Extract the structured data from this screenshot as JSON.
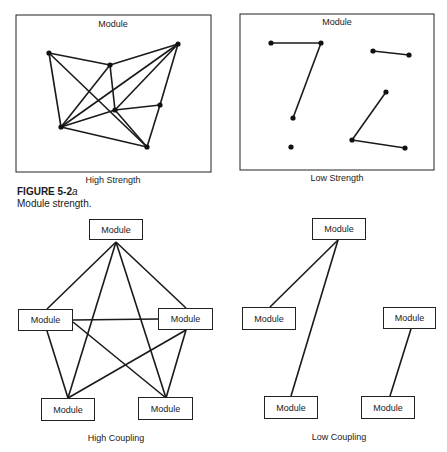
{
  "figure": {
    "number": "FIGURE 5-2",
    "suffix": "a",
    "caption": "Module strength."
  },
  "strength": {
    "high": {
      "title": "Module",
      "label": "High Strength",
      "nodes": [
        [
          49,
          53
        ],
        [
          110,
          65
        ],
        [
          178,
          44
        ],
        [
          115,
          110
        ],
        [
          160,
          105
        ],
        [
          61,
          127
        ],
        [
          147,
          147
        ]
      ],
      "edges": [
        [
          0,
          1
        ],
        [
          1,
          2
        ],
        [
          0,
          5
        ],
        [
          0,
          6
        ],
        [
          1,
          3
        ],
        [
          1,
          5
        ],
        [
          2,
          5
        ],
        [
          2,
          3
        ],
        [
          2,
          4
        ],
        [
          4,
          6
        ],
        [
          3,
          5
        ],
        [
          3,
          4
        ],
        [
          5,
          6
        ],
        [
          3,
          6
        ]
      ]
    },
    "low": {
      "title": "Module",
      "label": "Low Strength",
      "nodes": [
        [
          271,
          43
        ],
        [
          321,
          43
        ],
        [
          293,
          118
        ],
        [
          291,
          147
        ],
        [
          373,
          51
        ],
        [
          409,
          55
        ],
        [
          386,
          92
        ],
        [
          352,
          140
        ],
        [
          405,
          148
        ]
      ],
      "edges": [
        [
          0,
          1
        ],
        [
          1,
          2
        ],
        [
          4,
          5
        ],
        [
          6,
          7
        ],
        [
          7,
          8
        ]
      ]
    }
  },
  "coupling": {
    "high": {
      "label": "High Coupling",
      "modules": [
        {
          "label": "Module",
          "x": 89,
          "y": 219,
          "w": 54,
          "h": 21
        },
        {
          "label": "Module",
          "x": 18,
          "y": 309,
          "w": 55,
          "h": 22
        },
        {
          "label": "Module",
          "x": 158,
          "y": 308,
          "w": 55,
          "h": 22
        },
        {
          "label": "Module",
          "x": 41,
          "y": 398,
          "w": 54,
          "h": 23
        },
        {
          "label": "Module",
          "x": 138,
          "y": 397,
          "w": 55,
          "h": 23
        }
      ],
      "edges": [
        [
          [
            116,
            242
          ],
          [
            47,
            309
          ]
        ],
        [
          [
            116,
            242
          ],
          [
            68,
            398
          ]
        ],
        [
          [
            116,
            242
          ],
          [
            166,
            398
          ]
        ],
        [
          [
            116,
            242
          ],
          [
            186,
            308
          ]
        ],
        [
          [
            73,
            320
          ],
          [
            158,
            319
          ]
        ],
        [
          [
            47,
            331
          ],
          [
            68,
            398
          ]
        ],
        [
          [
            73,
            322
          ],
          [
            166,
            398
          ]
        ],
        [
          [
            186,
            330
          ],
          [
            68,
            398
          ]
        ],
        [
          [
            186,
            330
          ],
          [
            166,
            398
          ]
        ]
      ]
    },
    "low": {
      "label": "Low Coupling",
      "modules": [
        {
          "label": "Module",
          "x": 312,
          "y": 218,
          "w": 54,
          "h": 22
        },
        {
          "label": "Module",
          "x": 242,
          "y": 307,
          "w": 54,
          "h": 23
        },
        {
          "label": "Module",
          "x": 383,
          "y": 307,
          "w": 53,
          "h": 22
        },
        {
          "label": "Module",
          "x": 264,
          "y": 396,
          "w": 54,
          "h": 23
        },
        {
          "label": "Module",
          "x": 361,
          "y": 396,
          "w": 54,
          "h": 23
        }
      ],
      "edges": [
        [
          [
            338,
            240
          ],
          [
            270,
            307
          ]
        ],
        [
          [
            338,
            240
          ],
          [
            291,
            396
          ]
        ],
        [
          [
            411,
            329
          ],
          [
            390,
            396
          ]
        ]
      ]
    }
  }
}
